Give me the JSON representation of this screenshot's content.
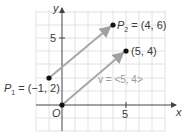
{
  "figure": {
    "axes": {
      "x_label": "x",
      "y_label": "y",
      "origin_label": "O",
      "x_tick_label": "5",
      "y_tick_label": "5"
    },
    "points": {
      "p1": {
        "name": "P",
        "sub": "1",
        "label": " = (−1, 2)",
        "x": -1,
        "y": 2
      },
      "p2": {
        "name": "P",
        "sub": "2",
        "label": " = (4, 6)",
        "x": 4,
        "y": 6
      },
      "origin": {
        "x": 0,
        "y": 0
      },
      "tip": {
        "label": "(5, 4)",
        "x": 5,
        "y": 4
      }
    },
    "vector_label": "v = <5, 4>",
    "colors": {
      "grid": "#e2e2e2",
      "axis": "#444444",
      "vector": "#a8a8a8",
      "point": "#111111"
    }
  }
}
